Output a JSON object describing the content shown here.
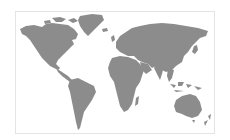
{
  "map": {
    "type": "world-map",
    "projection": "equirectangular-like",
    "land_color": "#8c8c8c",
    "water_color": "#ffffff",
    "border_color": "#e4e4e4",
    "regions": [
      "north-america",
      "greenland",
      "south-america",
      "europe",
      "africa",
      "asia",
      "australia",
      "new-zealand",
      "madagascar",
      "japan",
      "indonesia",
      "british-isles",
      "iceland"
    ]
  }
}
